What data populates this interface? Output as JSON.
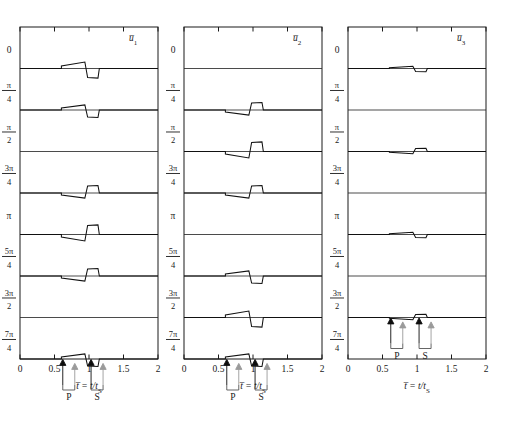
{
  "figure": {
    "title": "",
    "panels": [
      {
        "id": "panel-u1",
        "component_label": "u̅1",
        "component_base": "u̅",
        "component_sub": "1",
        "x_axis": {
          "label_base": "t̅",
          "label_rest": " = t/t",
          "label_sub": "S",
          "ticks": [
            0,
            0.5,
            1,
            1.5,
            2
          ],
          "tick_labels": [
            "0",
            "0.5",
            "1",
            "1.5",
            "2"
          ],
          "range": [
            0,
            2
          ]
        },
        "traces": [
          {
            "angle_label": "0",
            "num": "",
            "den": "",
            "kind": "up-down",
            "amp": 1.0
          },
          {
            "angle_label": "π/4",
            "num": "π",
            "den": "4",
            "kind": "up-down",
            "amp": 0.78
          },
          {
            "angle_label": "π/2",
            "num": "π",
            "den": "2",
            "kind": "flat",
            "amp": 0.0
          },
          {
            "angle_label": "3π/4",
            "num": "3π",
            "den": "4",
            "kind": "down-up",
            "amp": 0.78
          },
          {
            "angle_label": "π",
            "num": "",
            "den": "",
            "kind": "down-up",
            "amp": 1.0
          },
          {
            "angle_label": "5π/4",
            "num": "5π",
            "den": "4",
            "kind": "down-up",
            "amp": 0.78
          },
          {
            "angle_label": "3π/2",
            "num": "3π",
            "den": "2",
            "kind": "flat",
            "amp": 0.0
          },
          {
            "angle_label": "7π/4",
            "num": "7π",
            "den": "4",
            "kind": "up-down",
            "amp": 0.78
          }
        ],
        "markers": {
          "p_label": "P",
          "s_label": "S",
          "p_time": 0.62,
          "s_time": 1.03,
          "row_index": 7
        }
      },
      {
        "id": "panel-u2",
        "component_label": "u̅2",
        "component_base": "u̅",
        "component_sub": "2",
        "x_axis": {
          "label_base": "t̅",
          "label_rest": " = t/t",
          "label_sub": "S",
          "ticks": [
            0,
            0.5,
            1,
            1.5,
            2
          ],
          "tick_labels": [
            "0",
            "0.5",
            "1",
            "1.5",
            "2"
          ],
          "range": [
            0,
            2
          ]
        },
        "traces": [
          {
            "angle_label": "0",
            "num": "",
            "den": "",
            "kind": "flat",
            "amp": 0.0
          },
          {
            "angle_label": "π/4",
            "num": "π",
            "den": "4",
            "kind": "down-up",
            "amp": 0.78
          },
          {
            "angle_label": "π/2",
            "num": "π",
            "den": "2",
            "kind": "down-up",
            "amp": 1.0
          },
          {
            "angle_label": "3π/4",
            "num": "3π",
            "den": "4",
            "kind": "down-up",
            "amp": 0.78
          },
          {
            "angle_label": "π",
            "num": "",
            "den": "",
            "kind": "flat",
            "amp": 0.0
          },
          {
            "angle_label": "5π/4",
            "num": "5π",
            "den": "4",
            "kind": "up-down",
            "amp": 0.78
          },
          {
            "angle_label": "3π/2",
            "num": "3π",
            "den": "2",
            "kind": "up-down",
            "amp": 1.0
          },
          {
            "angle_label": "7π/4",
            "num": "7π",
            "den": "4",
            "kind": "up-down",
            "amp": 0.78
          }
        ],
        "markers": {
          "p_label": "P",
          "s_label": "S",
          "p_time": 0.62,
          "s_time": 1.03,
          "row_index": 7
        }
      },
      {
        "id": "panel-u3",
        "component_label": "u̅3",
        "component_base": "u̅",
        "component_sub": "3",
        "x_axis": {
          "label_base": "t̅",
          "label_rest": " = t/t",
          "label_sub": "S",
          "ticks": [
            0,
            0.5,
            1,
            1.5,
            2
          ],
          "tick_labels": [
            "0",
            "0.5",
            "1",
            "1.5",
            "2"
          ],
          "range": [
            0,
            2
          ]
        },
        "traces": [
          {
            "angle_label": "0",
            "num": "",
            "den": "",
            "kind": "up-down",
            "amp": 0.34
          },
          {
            "angle_label": "π/4",
            "num": "π",
            "den": "4",
            "kind": "flat",
            "amp": 0.0
          },
          {
            "angle_label": "π/2",
            "num": "π",
            "den": "2",
            "kind": "down-up",
            "amp": 0.34
          },
          {
            "angle_label": "3π/4",
            "num": "3π",
            "den": "4",
            "kind": "flat",
            "amp": 0.0
          },
          {
            "angle_label": "π",
            "num": "",
            "den": "",
            "kind": "up-down",
            "amp": 0.34
          },
          {
            "angle_label": "5π/4",
            "num": "5π",
            "den": "4",
            "kind": "flat",
            "amp": 0.0
          },
          {
            "angle_label": "3π/2",
            "num": "3π",
            "den": "2",
            "kind": "down-up",
            "amp": 0.34
          },
          {
            "angle_label": "7π/4",
            "num": "7π",
            "den": "4",
            "kind": "flat",
            "amp": 0.0
          }
        ],
        "markers": {
          "p_label": "P",
          "s_label": "S",
          "p_time": 0.62,
          "s_time": 1.03,
          "row_index": 6
        }
      }
    ],
    "colors": {
      "frame": "#1a1a1a",
      "trace": "#111111",
      "separator": "#2b2b2b",
      "arrow_dark": "#0d0d0d",
      "arrow_light": "#9a9a9a",
      "background": "#ffffff"
    }
  },
  "chart_data": {
    "type": "line",
    "title": "",
    "xlabel": "t̅ = t/t_S",
    "ylabel": "source azimuth (radians)",
    "xlim": [
      0,
      2
    ],
    "grid": false,
    "legend": "none",
    "subplots": [
      "u̅1",
      "u̅2",
      "u̅3"
    ],
    "categories": [
      "0",
      "π/4",
      "π/2",
      "3π/4",
      "π",
      "5π/4",
      "3π/2",
      "7π/4"
    ],
    "xticks": [
      0,
      0.5,
      1,
      1.5,
      2
    ],
    "annotations": [
      {
        "text": "P",
        "x": 0.62,
        "note": "P-wave arrival marker, dark + light arrow pair"
      },
      {
        "text": "S",
        "x": 1.03,
        "note": "S-wave arrival marker, dark + light arrow pair"
      }
    ],
    "series": [
      {
        "name": "u̅1",
        "amplitudes": [
          1.0,
          0.78,
          0.0,
          0.78,
          1.0,
          0.78,
          0.0,
          0.78
        ],
        "polarity": [
          "up-down",
          "up-down",
          "flat",
          "down-up",
          "down-up",
          "down-up",
          "flat",
          "up-down"
        ]
      },
      {
        "name": "u̅2",
        "amplitudes": [
          0.0,
          0.78,
          1.0,
          0.78,
          0.0,
          0.78,
          1.0,
          0.78
        ],
        "polarity": [
          "flat",
          "down-up",
          "down-up",
          "down-up",
          "flat",
          "up-down",
          "up-down",
          "up-down"
        ]
      },
      {
        "name": "u̅3",
        "amplitudes": [
          0.34,
          0.0,
          0.34,
          0.0,
          0.34,
          0.0,
          0.34,
          0.0
        ],
        "polarity": [
          "up-down",
          "flat",
          "down-up",
          "flat",
          "up-down",
          "flat",
          "down-up",
          "flat"
        ]
      }
    ]
  }
}
